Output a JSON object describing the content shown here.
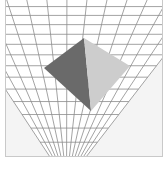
{
  "scene": {
    "description": "3D rendering of a square pyramid on a perspective grid plane",
    "colors": {
      "background": "#ffffff",
      "frame_fill": "#f4f4f4",
      "frame_border": "#c9c9c9",
      "plane_fill": "#ffffff",
      "grid_line": "#8c8c8c",
      "pyramid_left_face": "#6a6a6a",
      "pyramid_right_face": "#cdcdcd"
    },
    "frame": {
      "x": 5,
      "y": 0,
      "w": 158,
      "h": 157
    },
    "plane": {
      "corners": [
        [
          -40,
          -30
        ],
        [
          230,
          -30
        ],
        [
          86,
          157
        ],
        [
          50,
          157
        ]
      ]
    },
    "pyramid": {
      "apex": [
        84,
        38
      ],
      "left": [
        44,
        68
      ],
      "bottom": [
        91,
        111
      ],
      "right": [
        130,
        66
      ]
    }
  }
}
